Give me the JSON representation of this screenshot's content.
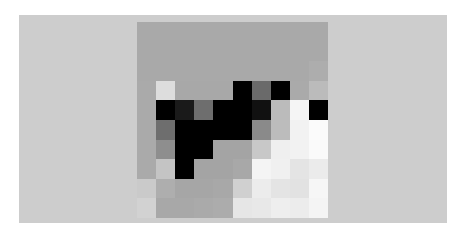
{
  "image": {
    "panel_color": "#cdcdcd",
    "background_color": "#ffffff",
    "grid": {
      "columns": 10,
      "rows": 10,
      "cells": [
        [
          "#a9a9a9",
          "#a9a9a9",
          "#a9a9a9",
          "#a9a9a9",
          "#a9a9a9",
          "#a9a9a9",
          "#a9a9a9",
          "#a9a9a9",
          "#a9a9a9",
          "#a9a9a9"
        ],
        [
          "#a9a9a9",
          "#a9a9a9",
          "#a9a9a9",
          "#a9a9a9",
          "#a9a9a9",
          "#a9a9a9",
          "#a9a9a9",
          "#a9a9a9",
          "#a9a9a9",
          "#a9a9a9"
        ],
        [
          "#a9a9a9",
          "#a9a9a9",
          "#a9a9a9",
          "#a9a9a9",
          "#a9a9a9",
          "#a9a9a9",
          "#a9a9a9",
          "#a9a9a9",
          "#a9a9a9",
          "#adadad"
        ],
        [
          "#aaaaaa",
          "#dddddd",
          "#a8a8a8",
          "#a8a8a8",
          "#a8a8a8",
          "#000000",
          "#6a6a6a",
          "#000000",
          "#aaaaaa",
          "#bbbbbb"
        ],
        [
          "#aaaaaa",
          "#000000",
          "#1a1a1a",
          "#6e6e6e",
          "#000000",
          "#000000",
          "#111111",
          "#bbbbbb",
          "#f5f5f5",
          "#000000"
        ],
        [
          "#aaaaaa",
          "#6e6e6e",
          "#000000",
          "#000000",
          "#000000",
          "#000000",
          "#8a8a8a",
          "#bcbcbc",
          "#f2f2f2",
          "#fbfbfb"
        ],
        [
          "#aaaaaa",
          "#8e8e8e",
          "#000000",
          "#000000",
          "#a4a4a4",
          "#a4a4a4",
          "#c8c8c8",
          "#efefef",
          "#f2f2f2",
          "#fafafa"
        ],
        [
          "#aaaaaa",
          "#c4c4c4",
          "#000000",
          "#a4a4a4",
          "#a4a4a4",
          "#a8a8a8",
          "#f4f4f4",
          "#f0f0f0",
          "#e4e4e4",
          "#ebebeb"
        ],
        [
          "#cacaca",
          "#aeaeae",
          "#a6a6a6",
          "#a6a6a6",
          "#a8a8a8",
          "#d0d0d0",
          "#ececec",
          "#e4e4e4",
          "#e2e2e2",
          "#f6f6f6"
        ],
        [
          "#d2d2d2",
          "#a8a8a8",
          "#a8a8a8",
          "#aaaaaa",
          "#acacac",
          "#e6e6e6",
          "#e8e8e8",
          "#eeeeee",
          "#ececec",
          "#f4f4f4"
        ]
      ]
    }
  }
}
